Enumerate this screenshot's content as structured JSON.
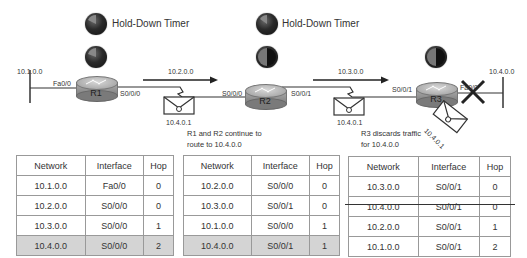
{
  "diagram": {
    "timers": [
      {
        "label": "Hold-Down Timer"
      },
      {
        "label": "Hold-Down Timer"
      }
    ],
    "routers": [
      {
        "name": "R1",
        "left_interface": "Fa0/0",
        "right_interface": "S0/0/0"
      },
      {
        "name": "R2",
        "left_interface": "S0/0/0",
        "right_interface": "S0/0/1"
      },
      {
        "name": "R3",
        "left_interface": "S0/0/1",
        "right_interface": "Fa0/0"
      }
    ],
    "networks": {
      "left_lan": "10.1.0.0",
      "link_r1_r2": "10.2.0.0",
      "link_r2_r3": "10.3.0.0",
      "right_lan": "10.4.0.0"
    },
    "packets": [
      {
        "label": "10.4.0.1"
      },
      {
        "label": "10.4.0.1"
      },
      {
        "label": "10.4.0.1"
      }
    ],
    "notes": {
      "r1_r2": [
        "R1 and R2 continue to",
        "route to 10.4.0.0"
      ],
      "r3": [
        "R3 discards traffic",
        "for 10.4.0.0"
      ]
    },
    "link_failure_marker": "X"
  },
  "tables": [
    {
      "router": "R1",
      "headers": [
        "Network",
        "Interface",
        "Hop"
      ],
      "rows": [
        {
          "network": "10.1.0.0",
          "interface": "Fa0/0",
          "hop": "0",
          "highlight": false,
          "struck": false
        },
        {
          "network": "10.2.0.0",
          "interface": "S0/0/0",
          "hop": "0",
          "highlight": false,
          "struck": false
        },
        {
          "network": "10.3.0.0",
          "interface": "S0/0/0",
          "hop": "1",
          "highlight": false,
          "struck": false
        },
        {
          "network": "10.4.0.0",
          "interface": "S0/0/0",
          "hop": "2",
          "highlight": true,
          "struck": false
        }
      ]
    },
    {
      "router": "R2",
      "headers": [
        "Network",
        "Interface",
        "Hop"
      ],
      "rows": [
        {
          "network": "10.2.0.0",
          "interface": "S0/0/0",
          "hop": "0",
          "highlight": false,
          "struck": false
        },
        {
          "network": "10.3.0.0",
          "interface": "S0/0/1",
          "hop": "0",
          "highlight": false,
          "struck": false
        },
        {
          "network": "10.1.0.0",
          "interface": "S0/0/0",
          "hop": "1",
          "highlight": false,
          "struck": false
        },
        {
          "network": "10.4.0.0",
          "interface": "S0/0/1",
          "hop": "1",
          "highlight": true,
          "struck": false
        }
      ]
    },
    {
      "router": "R3",
      "headers": [
        "Network",
        "Interface",
        "Hop"
      ],
      "rows": [
        {
          "network": "10.3.0.0",
          "interface": "S0/0/1",
          "hop": "0",
          "highlight": false,
          "struck": false
        },
        {
          "network": "10.4.0.0",
          "interface": "S0/0/1",
          "hop": "0",
          "highlight": false,
          "struck": true
        },
        {
          "network": "10.2.0.0",
          "interface": "S0/0/1",
          "hop": "1",
          "highlight": false,
          "struck": false
        },
        {
          "network": "10.1.0.0",
          "interface": "S0/0/1",
          "hop": "2",
          "highlight": false,
          "struck": false
        }
      ]
    }
  ],
  "colors": {
    "line": "#333333",
    "highlight_row": "#d4d4d4",
    "table_border": "#999999"
  }
}
